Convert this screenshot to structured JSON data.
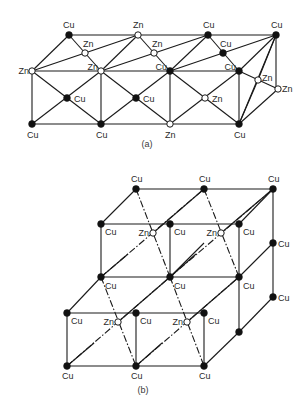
{
  "figure": {
    "type": "crystal-structure-diagram",
    "legend": {
      "filled_circle": "Cu",
      "open_circle": "Zn"
    },
    "colors": {
      "line": "#1a1a1a",
      "cu_fill": "#111111",
      "zn_fill": "#ffffff"
    },
    "panels": [
      {
        "id": "a",
        "caption": "(a)",
        "caption_pos": [
          147,
          147
        ],
        "atoms": [
          {
            "label": "Cu",
            "x": 69,
            "y": 35,
            "lx": 63,
            "ly": 28,
            "anchor": "start"
          },
          {
            "label": "Zn",
            "x": 138,
            "y": 35,
            "lx": 133,
            "ly": 28,
            "anchor": "start"
          },
          {
            "label": "Cu",
            "x": 208,
            "y": 35,
            "lx": 203,
            "ly": 28,
            "anchor": "start"
          },
          {
            "label": "Cu",
            "x": 276,
            "y": 35,
            "lx": 271,
            "ly": 28,
            "anchor": "start"
          },
          {
            "label": "Zn",
            "x": 85,
            "y": 53,
            "lx": 83,
            "ly": 47,
            "anchor": "start"
          },
          {
            "label": "Zn",
            "x": 154,
            "y": 53,
            "lx": 152,
            "ly": 47,
            "anchor": "start"
          },
          {
            "label": "Cu",
            "x": 223,
            "y": 53,
            "lx": 220,
            "ly": 47,
            "anchor": "start"
          },
          {
            "label": "Zn",
            "x": 32,
            "y": 71,
            "lx": 29,
            "ly": 74,
            "anchor": "end"
          },
          {
            "label": "Zn",
            "x": 101,
            "y": 71,
            "lx": 98,
            "ly": 70,
            "anchor": "end"
          },
          {
            "label": "Cu",
            "x": 170,
            "y": 71,
            "lx": 167,
            "ly": 70,
            "anchor": "end"
          },
          {
            "label": "Cu",
            "x": 239,
            "y": 71,
            "lx": 236,
            "ly": 70,
            "anchor": "end"
          },
          {
            "label": "Zn",
            "x": 258,
            "y": 80,
            "lx": 262,
            "ly": 81,
            "anchor": "start"
          },
          {
            "label": "Zn",
            "x": 278,
            "y": 89,
            "lx": 282,
            "ly": 92,
            "anchor": "start"
          },
          {
            "label": "Cu",
            "x": 67,
            "y": 98,
            "lx": 74,
            "ly": 102,
            "anchor": "start"
          },
          {
            "label": "Cu",
            "x": 136,
            "y": 98,
            "lx": 143,
            "ly": 102,
            "anchor": "start"
          },
          {
            "label": "Zn",
            "x": 205,
            "y": 98,
            "lx": 212,
            "ly": 102,
            "anchor": "start"
          },
          {
            "label": "Cu",
            "x": 32,
            "y": 124,
            "lx": 27,
            "ly": 138,
            "anchor": "start"
          },
          {
            "label": "Cu",
            "x": 101,
            "y": 124,
            "lx": 96,
            "ly": 138,
            "anchor": "start"
          },
          {
            "label": "Zn",
            "x": 170,
            "y": 124,
            "lx": 165,
            "ly": 138,
            "anchor": "start"
          },
          {
            "label": "Cu",
            "x": 239,
            "y": 124,
            "lx": 234,
            "ly": 138,
            "anchor": "start"
          }
        ],
        "bonds": [
          [
            69,
            35,
            276,
            35
          ],
          [
            32,
            71,
            239,
            71
          ],
          [
            32,
            124,
            239,
            124
          ],
          [
            32,
            71,
            32,
            124
          ],
          [
            101,
            71,
            101,
            124
          ],
          [
            170,
            71,
            170,
            124
          ],
          [
            239,
            71,
            239,
            124
          ],
          [
            276,
            35,
            276,
            89
          ],
          [
            32,
            71,
            69,
            35
          ],
          [
            101,
            71,
            138,
            35
          ],
          [
            170,
            71,
            208,
            35
          ],
          [
            239,
            71,
            276,
            35
          ],
          [
            69,
            35,
            101,
            71
          ],
          [
            138,
            35,
            170,
            71
          ],
          [
            208,
            35,
            239,
            71
          ],
          [
            32,
            71,
            138,
            35
          ],
          [
            101,
            71,
            208,
            35
          ],
          [
            170,
            71,
            276,
            35
          ],
          [
            32,
            71,
            101,
            124
          ],
          [
            101,
            71,
            32,
            124
          ],
          [
            101,
            71,
            170,
            124
          ],
          [
            170,
            71,
            101,
            124
          ],
          [
            170,
            71,
            239,
            124
          ],
          [
            239,
            71,
            170,
            124
          ],
          [
            239,
            71,
            278,
            89
          ],
          [
            239,
            124,
            276,
            35
          ],
          [
            239,
            124,
            278,
            89
          ],
          [
            239,
            124,
            258,
            80
          ],
          [
            258,
            80,
            276,
            35
          ]
        ],
        "dashed_bonds": []
      },
      {
        "id": "b",
        "caption": "(b)",
        "caption_pos": [
          143,
          393
        ],
        "atoms": [
          {
            "label": "Cu",
            "x": 136,
            "y": 189,
            "lx": 131,
            "ly": 182,
            "anchor": "start"
          },
          {
            "label": "Cu",
            "x": 204,
            "y": 189,
            "lx": 199,
            "ly": 182,
            "anchor": "start"
          },
          {
            "label": "Cu",
            "x": 273,
            "y": 189,
            "lx": 268,
            "ly": 182,
            "anchor": "start"
          },
          {
            "label": "Cu",
            "x": 101,
            "y": 224,
            "lx": 105,
            "ly": 235,
            "anchor": "start"
          },
          {
            "label": "Zn",
            "x": 153,
            "y": 233,
            "lx": 149,
            "ly": 236,
            "anchor": "end"
          },
          {
            "label": "Cu",
            "x": 170,
            "y": 224,
            "lx": 174,
            "ly": 235,
            "anchor": "start"
          },
          {
            "label": "Zn",
            "x": 221,
            "y": 233,
            "lx": 217,
            "ly": 236,
            "anchor": "end"
          },
          {
            "label": "Cu",
            "x": 239,
            "y": 224,
            "lx": 243,
            "ly": 235,
            "anchor": "start"
          },
          {
            "label": "Cu",
            "x": 273,
            "y": 243,
            "lx": 278,
            "ly": 247,
            "anchor": "start"
          },
          {
            "label": "Cu",
            "x": 101,
            "y": 277,
            "lx": 105,
            "ly": 289,
            "anchor": "start"
          },
          {
            "label": "Cu",
            "x": 170,
            "y": 277,
            "lx": 174,
            "ly": 289,
            "anchor": "start"
          },
          {
            "label": "Cu",
            "x": 239,
            "y": 277,
            "lx": 243,
            "ly": 289,
            "anchor": "start"
          },
          {
            "label": "Cu",
            "x": 273,
            "y": 297,
            "lx": 278,
            "ly": 301,
            "anchor": "start"
          },
          {
            "label": "Cu",
            "x": 67,
            "y": 313,
            "lx": 71,
            "ly": 324,
            "anchor": "start"
          },
          {
            "label": "Zn",
            "x": 118,
            "y": 322,
            "lx": 114,
            "ly": 325,
            "anchor": "end"
          },
          {
            "label": "Cu",
            "x": 136,
            "y": 313,
            "lx": 140,
            "ly": 324,
            "anchor": "start"
          },
          {
            "label": "Zn",
            "x": 187,
            "y": 322,
            "lx": 183,
            "ly": 325,
            "anchor": "end"
          },
          {
            "label": "Cu",
            "x": 204,
            "y": 313,
            "lx": 208,
            "ly": 324,
            "anchor": "start"
          },
          {
            "label": "",
            "x": 239,
            "y": 332,
            "lx": 0,
            "ly": 0,
            "anchor": "start"
          },
          {
            "label": "Cu",
            "x": 67,
            "y": 366,
            "lx": 62,
            "ly": 379,
            "anchor": "start"
          },
          {
            "label": "Cu",
            "x": 136,
            "y": 366,
            "lx": 131,
            "ly": 379,
            "anchor": "start"
          },
          {
            "label": "Cu",
            "x": 204,
            "y": 366,
            "lx": 199,
            "ly": 379,
            "anchor": "start"
          }
        ],
        "bonds": [
          [
            136,
            189,
            273,
            189
          ],
          [
            101,
            224,
            239,
            224
          ],
          [
            101,
            277,
            239,
            277
          ],
          [
            67,
            313,
            204,
            313
          ],
          [
            67,
            366,
            204,
            366
          ],
          [
            101,
            224,
            101,
            277
          ],
          [
            170,
            224,
            170,
            277
          ],
          [
            239,
            224,
            239,
            332
          ],
          [
            273,
            189,
            273,
            297
          ],
          [
            67,
            313,
            67,
            366
          ],
          [
            136,
            313,
            136,
            366
          ],
          [
            204,
            313,
            204,
            366
          ],
          [
            101,
            224,
            136,
            189
          ],
          [
            239,
            224,
            273,
            189
          ],
          [
            239,
            277,
            273,
            243
          ],
          [
            239,
            332,
            273,
            297
          ],
          [
            204,
            366,
            239,
            332
          ],
          [
            67,
            313,
            101,
            277
          ],
          [
            170,
            277,
            204,
            243
          ]
        ],
        "dashed_bonds": [
          [
            136,
            189,
            170,
            277
          ],
          [
            204,
            189,
            239,
            277
          ],
          [
            101,
            277,
            136,
            366
          ],
          [
            170,
            277,
            204,
            366
          ],
          [
            101,
            277,
            204,
            189
          ],
          [
            170,
            277,
            273,
            189
          ],
          [
            67,
            366,
            170,
            277
          ],
          [
            136,
            366,
            239,
            277
          ]
        ],
        "solid_diagonals": [
          [
            153,
            233,
            204,
            189
          ],
          [
            221,
            233,
            273,
            189
          ],
          [
            118,
            322,
            170,
            277
          ],
          [
            187,
            322,
            239,
            277
          ],
          [
            101,
            277,
            128,
            254
          ],
          [
            170,
            277,
            196,
            254
          ],
          [
            67,
            366,
            94,
            343
          ],
          [
            136,
            366,
            162,
            343
          ]
        ]
      }
    ]
  }
}
